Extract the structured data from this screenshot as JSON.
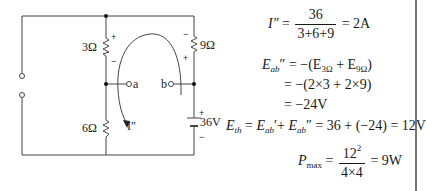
{
  "circuit": {
    "resistors": [
      {
        "id": "r1",
        "label": "3Ω",
        "polarity_top": "+",
        "polarity_bottom": "−"
      },
      {
        "id": "r2",
        "label": "9Ω",
        "polarity_top": "−",
        "polarity_bottom": "+"
      },
      {
        "id": "r3",
        "label": "6Ω"
      }
    ],
    "source": {
      "label": "36V",
      "polarity_top": "+",
      "polarity_bottom": "−"
    },
    "terminals": {
      "a": "a",
      "b": "b"
    },
    "current_label": "I″",
    "colors": {
      "wire": "#444444",
      "text": "#1a1a1a",
      "background": "#ffffff"
    }
  },
  "equations": {
    "current": {
      "lhs": "I″",
      "num": "36",
      "den": "3+6+9",
      "rhs": "= 2A"
    },
    "eab_pp": {
      "line1_lhs_main": "E",
      "line1_lhs_sub": "ab",
      "line1_lhs_mark": "″",
      "line1_rhs_a": "= −(E",
      "line1_sub1": "3Ω",
      "line1_mid": " + E",
      "line1_sub2": "9Ω",
      "line1_end": ")",
      "line2": "= −(2×3 + 2×9)",
      "line3": "= −24V"
    },
    "eth": {
      "lhs_main": "E",
      "lhs_sub": "th",
      "t1_main": "E",
      "t1_sub": "ab",
      "t1_mark": "′",
      "t2_main": "E",
      "t2_sub": "ab",
      "t2_mark": "″",
      "rhs": "= 36 + (−24) = 12V"
    },
    "pmax": {
      "lhs_main": "P",
      "lhs_sub": "max",
      "num_base": "12",
      "num_exp": "2",
      "den": "4×4",
      "rhs": "= 9W"
    }
  }
}
